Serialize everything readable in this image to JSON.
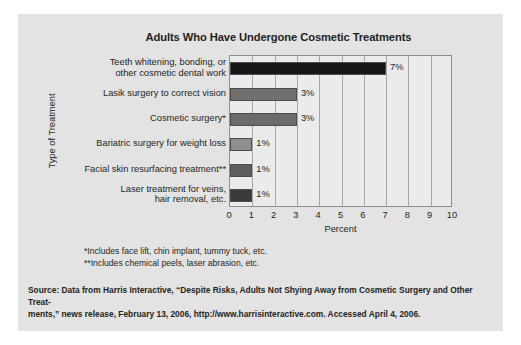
{
  "chart_data": {
    "type": "bar",
    "orientation": "horizontal",
    "title": "Adults Who Have Undergone Cosmetic Treatments",
    "xlabel": "Percent",
    "ylabel": "Type of Treatment",
    "xlim": [
      0,
      10
    ],
    "xticks": [
      "0",
      "1",
      "2",
      "3",
      "4",
      "5",
      "6",
      "7",
      "8",
      "9",
      "10"
    ],
    "grid": true,
    "legend": "none",
    "categories": [
      "Teeth whitening, bonding, or\nother cosmetic dental work",
      "Lasik surgery to correct vision",
      "Cosmetic surgery*",
      "Bariatric surgery for weight loss",
      "Facial skin resurfacing treatment**",
      "Laser treatment for veins,\nhair removal, etc."
    ],
    "values": [
      7,
      3,
      3,
      1,
      1,
      1
    ],
    "value_labels": [
      "7%",
      "3%",
      "3%",
      "1%",
      "1%",
      "1%"
    ],
    "bar_colors": [
      "#151515",
      "#707070",
      "#6b6b6b",
      "#8f8f8f",
      "#5e5e5e",
      "#3a3a3a"
    ]
  },
  "footnotes": [
    "*Includes face lift, chin implant, tummy tuck, etc.",
    "**Includes chemical peels, laser abrasion, etc."
  ],
  "source": {
    "line1": "Source: Data from Harris Interactive, “Despite Risks, Adults Not Shying Away from Cosmetic Surgery and Other Treat-",
    "line2": "ments,” news release, February 13, 2006, http://www.harrisinteractive.com. Accessed April 4, 2006."
  },
  "colors": {
    "panel_background": "#e3e3e3",
    "plot_background": "#ebebeb",
    "text": "#231f20",
    "gridline": "#a8a8a8",
    "frame": "#8e8e8e"
  }
}
